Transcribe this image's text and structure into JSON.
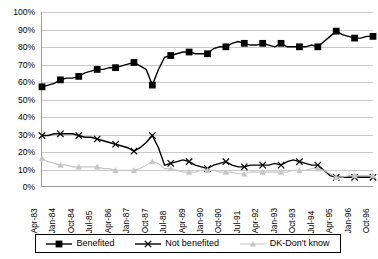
{
  "chart_data": {
    "type": "line",
    "title": "",
    "xlabel": "",
    "ylabel": "",
    "ylim": [
      0,
      100
    ],
    "ytick_labels": [
      "0%",
      "10%",
      "20%",
      "30%",
      "40%",
      "50%",
      "60%",
      "70%",
      "80%",
      "90%",
      "100%"
    ],
    "ytick_values": [
      0,
      10,
      20,
      30,
      40,
      50,
      60,
      70,
      80,
      90,
      100
    ],
    "grid": true,
    "legend_position": "bottom",
    "x": [
      "Apr-83",
      "Jul-83",
      "Oct-83",
      "Jan-84",
      "Apr-84",
      "Jul-84",
      "Oct-84",
      "Jan-85",
      "Apr-85",
      "Jul-85",
      "Oct-85",
      "Jan-86",
      "Apr-86",
      "Jul-86",
      "Oct-86",
      "Jan-87",
      "Apr-87",
      "Jul-87",
      "Oct-87",
      "Jan-88",
      "Apr-88",
      "Jul-88",
      "Oct-88",
      "Jan-89",
      "Apr-89",
      "Jul-89",
      "Oct-89",
      "Jan-90",
      "Apr-90",
      "Jul-90",
      "Oct-90",
      "Jan-91",
      "Apr-91",
      "Jul-91",
      "Oct-91",
      "Jan-92",
      "Apr-92",
      "Jul-92",
      "Oct-92",
      "Jan-93",
      "Apr-93",
      "Jul-93",
      "Oct-93",
      "Jan-94",
      "Apr-94",
      "Jul-94",
      "Oct-94",
      "Jan-95",
      "Apr-95",
      "Jul-95",
      "Oct-95",
      "Jan-96",
      "Apr-96",
      "Jul-96",
      "Oct-96"
    ],
    "xtick_labels": [
      "Apr-83",
      "Jan-84",
      "Oct-84",
      "Jul-85",
      "Apr-86",
      "Jan-87",
      "Oct-87",
      "Jul-88",
      "Apr-89",
      "Jan-90",
      "Oct-90",
      "Jul-91",
      "Apr-92",
      "Jan-93",
      "Oct-93",
      "Jul-94",
      "Apr-95",
      "Jan-96",
      "Oct-96"
    ],
    "xtick_indices": [
      0,
      3,
      6,
      9,
      12,
      15,
      18,
      21,
      24,
      27,
      30,
      33,
      36,
      39,
      42,
      45,
      48,
      51,
      54
    ],
    "categories": [
      "Apr-83",
      "Jan-84",
      "Oct-84",
      "Jul-85",
      "Apr-86",
      "Jan-87",
      "Oct-87",
      "Jul-88",
      "Apr-89",
      "Jan-90",
      "Oct-90",
      "Jul-91",
      "Apr-92",
      "Jan-93",
      "Oct-93",
      "Jul-94",
      "Apr-95",
      "Jan-96",
      "Oct-96"
    ],
    "series": [
      {
        "name": "Benefited",
        "color": "#000000",
        "marker": "square",
        "point_indices": [
          0,
          3,
          6,
          9,
          12,
          15,
          18,
          21,
          24,
          27,
          30,
          33,
          36,
          39,
          42,
          45,
          48,
          51,
          54
        ],
        "values": [
          57,
          61,
          63,
          67,
          68,
          71,
          58,
          74,
          77,
          76,
          80,
          83,
          81,
          82,
          80,
          80,
          89,
          85,
          86
        ]
      },
      {
        "name": "Not benefited",
        "color": "#000000",
        "marker": "x",
        "point_indices": [
          0,
          3,
          6,
          9,
          12,
          15,
          18,
          21,
          24,
          27,
          30,
          33,
          36,
          39,
          42,
          45,
          48,
          51,
          54
        ],
        "values": [
          29,
          30,
          29,
          27,
          24,
          20,
          29,
          12,
          15,
          10,
          14,
          11,
          12,
          12,
          15,
          12,
          5,
          5,
          5
        ]
      },
      {
        "name": "DK-Don't know",
        "color": "#c6c6c6",
        "marker": "triangle",
        "point_indices": [
          0,
          3,
          6,
          9,
          12,
          15,
          18,
          21,
          24,
          27,
          30,
          33,
          36,
          39,
          42,
          45,
          48,
          51,
          54
        ],
        "values": [
          16,
          12,
          11,
          11,
          9,
          9,
          14,
          10,
          8,
          9,
          8,
          7,
          8,
          8,
          8,
          10,
          5,
          6,
          6
        ]
      }
    ],
    "series_dense": {
      "Benefited": [
        57,
        58,
        59,
        61,
        62,
        62,
        63,
        65,
        66,
        67,
        67,
        68,
        68,
        69,
        70,
        71,
        69,
        67,
        58,
        67,
        74,
        75,
        76,
        77,
        77,
        76,
        76,
        76,
        79,
        80,
        80,
        82,
        83,
        82,
        81,
        81,
        82,
        81,
        80,
        82,
        80,
        80,
        80,
        80,
        81,
        80,
        83,
        86,
        89,
        87,
        86,
        85,
        85,
        86,
        86
      ],
      "Not benefited": [
        29,
        29,
        30,
        30,
        30,
        30,
        29,
        28,
        28,
        27,
        26,
        25,
        24,
        23,
        22,
        20,
        22,
        25,
        29,
        22,
        12,
        13,
        14,
        15,
        14,
        12,
        11,
        10,
        12,
        13,
        14,
        12,
        11,
        11,
        12,
        12,
        12,
        12,
        13,
        12,
        14,
        15,
        14,
        13,
        12,
        12,
        9,
        6,
        5,
        5,
        5,
        5,
        5,
        5,
        5
      ],
      "DK-Don't know": [
        16,
        14,
        13,
        12,
        12,
        11,
        11,
        11,
        11,
        11,
        10,
        10,
        9,
        9,
        9,
        9,
        10,
        12,
        14,
        13,
        10,
        10,
        9,
        8,
        8,
        8,
        9,
        9,
        9,
        8,
        8,
        8,
        7,
        7,
        8,
        8,
        8,
        8,
        8,
        8,
        8,
        9,
        9,
        9,
        10,
        10,
        9,
        7,
        5,
        5,
        6,
        6,
        6,
        6,
        6
      ]
    }
  },
  "legend": {
    "items": [
      {
        "label": "Benefited"
      },
      {
        "label": "Not benefited"
      },
      {
        "label": "DK-Don't know"
      }
    ]
  }
}
